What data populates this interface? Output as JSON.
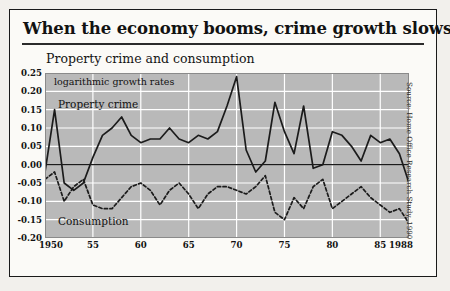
{
  "header": {
    "title": "When the economy booms, crime growth slows",
    "subtitle": "Property crime and consumption"
  },
  "source": "Source: Home Office Research Study, 1990",
  "annotations": {
    "log_rates": "logarithmic growth rates",
    "series_property": "Property crime",
    "series_consumption": "Consumption"
  },
  "colors": {
    "plot_background": "#b9b9b9",
    "gridline": "#ffffff",
    "line": "#1b1b1b",
    "frame": "#1a1a1a",
    "page_background": "#fbfaf7"
  },
  "chart_data": {
    "type": "line",
    "title": "Property crime and consumption",
    "subtitle": "logarithmic growth rates",
    "xlabel": "",
    "ylabel": "",
    "xlim": [
      1950,
      1988
    ],
    "ylim": [
      -0.2,
      0.25
    ],
    "ytick_step": 0.05,
    "yticks": [
      0.25,
      0.2,
      0.15,
      0.1,
      0.05,
      0.0,
      -0.05,
      -0.1,
      -0.15,
      -0.2
    ],
    "ytick_labels": [
      "0.25",
      "0.20",
      "0.15",
      "0.10",
      "0.05",
      "0.00",
      "-0.05",
      "-0.10",
      "-0.15",
      "-0.20"
    ],
    "xticks": [
      1950,
      1955,
      1960,
      1965,
      1970,
      1975,
      1980,
      1985,
      1988
    ],
    "xtick_labels": [
      "1950",
      "55",
      "60",
      "65",
      "70",
      "75",
      "80",
      "85",
      "1988"
    ],
    "grid": true,
    "grid_orientation": "both",
    "legend": "inline-annotations",
    "zero_line": 0.0,
    "x": [
      1950,
      1951,
      1952,
      1953,
      1954,
      1955,
      1956,
      1957,
      1958,
      1959,
      1960,
      1961,
      1962,
      1963,
      1964,
      1965,
      1966,
      1967,
      1968,
      1969,
      1970,
      1971,
      1972,
      1973,
      1974,
      1975,
      1976,
      1977,
      1978,
      1979,
      1980,
      1981,
      1982,
      1983,
      1984,
      1985,
      1986,
      1987,
      1988
    ],
    "series": [
      {
        "name": "Property crime",
        "style": "solid",
        "values": [
          -0.02,
          0.15,
          -0.05,
          -0.07,
          -0.05,
          0.02,
          0.08,
          0.1,
          0.13,
          0.08,
          0.06,
          0.07,
          0.07,
          0.1,
          0.07,
          0.06,
          0.08,
          0.07,
          0.09,
          0.16,
          0.24,
          0.04,
          -0.02,
          0.01,
          0.17,
          0.09,
          0.03,
          0.16,
          -0.01,
          0.0,
          0.09,
          0.08,
          0.05,
          0.01,
          0.08,
          0.06,
          0.07,
          0.03,
          -0.05
        ]
      },
      {
        "name": "Consumption",
        "style": "dashed",
        "values": [
          -0.04,
          -0.02,
          -0.1,
          -0.06,
          -0.04,
          -0.11,
          -0.12,
          -0.12,
          -0.09,
          -0.06,
          -0.05,
          -0.07,
          -0.11,
          -0.07,
          -0.05,
          -0.08,
          -0.12,
          -0.08,
          -0.06,
          -0.06,
          -0.07,
          -0.08,
          -0.06,
          -0.03,
          -0.13,
          -0.15,
          -0.09,
          -0.12,
          -0.06,
          -0.04,
          -0.12,
          -0.1,
          -0.08,
          -0.06,
          -0.09,
          -0.11,
          -0.13,
          -0.12,
          -0.16
        ]
      }
    ]
  }
}
